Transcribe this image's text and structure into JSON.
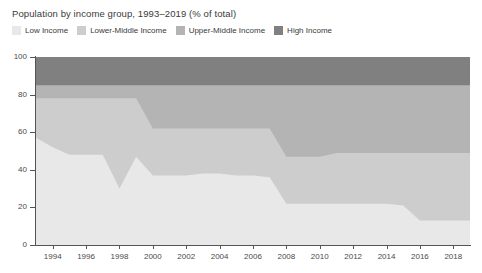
{
  "title": "Population by income group, 1993–2019 (% of total)",
  "legend": {
    "items": [
      {
        "label": "Low Income",
        "color": "#e8e8e8",
        "swatch_name": "legend-swatch-low-income"
      },
      {
        "label": "Lower-Middle Income",
        "color": "#cdcdcd",
        "swatch_name": "legend-swatch-lower-middle-income"
      },
      {
        "label": "Upper-Middle Income",
        "color": "#b4b4b4",
        "swatch_name": "legend-swatch-upper-middle-income"
      },
      {
        "label": "High Income",
        "color": "#808080",
        "swatch_name": "legend-swatch-high-income"
      }
    ]
  },
  "axes": {
    "y_ticks": [
      "0",
      "20",
      "40",
      "60",
      "80",
      "100"
    ],
    "x_ticks": [
      "1994",
      "1996",
      "1998",
      "2000",
      "2002",
      "2004",
      "2006",
      "2008",
      "2010",
      "2012",
      "2014",
      "2016",
      "2018"
    ]
  },
  "chart_data": {
    "type": "area",
    "title": "Population by income group, 1993–2019 (% of total)",
    "xlabel": "",
    "ylabel": "",
    "ylim": [
      0,
      100
    ],
    "xlim": [
      1993,
      2019
    ],
    "stacked": true,
    "grid": false,
    "legend_position": "top-left",
    "x": [
      1993,
      1994,
      1995,
      1996,
      1997,
      1998,
      1999,
      2000,
      2001,
      2002,
      2003,
      2004,
      2005,
      2006,
      2007,
      2008,
      2009,
      2010,
      2011,
      2012,
      2013,
      2014,
      2015,
      2016,
      2017,
      2018,
      2019
    ],
    "categories": [
      "1993",
      "1994",
      "1995",
      "1996",
      "1997",
      "1998",
      "1999",
      "2000",
      "2001",
      "2002",
      "2003",
      "2004",
      "2005",
      "2006",
      "2007",
      "2008",
      "2009",
      "2010",
      "2011",
      "2012",
      "2013",
      "2014",
      "2015",
      "2016",
      "2017",
      "2018",
      "2019"
    ],
    "series": [
      {
        "name": "Low Income",
        "color": "#e8e8e8",
        "values": [
          57,
          52,
          48,
          48,
          48,
          30,
          47,
          37,
          37,
          37,
          38,
          38,
          37,
          37,
          36,
          22,
          22,
          22,
          22,
          22,
          22,
          22,
          21,
          13,
          13,
          13,
          13
        ]
      },
      {
        "name": "Lower-Middle Income",
        "color": "#cdcdcd",
        "values": [
          21,
          26,
          30,
          30,
          30,
          48,
          31,
          25,
          25,
          25,
          24,
          24,
          25,
          25,
          26,
          25,
          25,
          25,
          27,
          27,
          27,
          27,
          28,
          36,
          36,
          36,
          36
        ]
      },
      {
        "name": "Upper-Middle Income",
        "color": "#b4b4b4",
        "values": [
          7,
          7,
          7,
          7,
          7,
          7,
          7,
          23,
          23,
          23,
          23,
          23,
          23,
          23,
          23,
          38,
          38,
          38,
          36,
          36,
          36,
          36,
          36,
          36,
          36,
          36,
          36
        ]
      },
      {
        "name": "High Income",
        "color": "#808080",
        "values": [
          15,
          15,
          15,
          15,
          15,
          15,
          15,
          15,
          15,
          15,
          15,
          15,
          15,
          15,
          15,
          15,
          15,
          15,
          15,
          15,
          15,
          15,
          15,
          15,
          15,
          15,
          15
        ]
      }
    ],
    "cumulative_tops": {
      "low_income": [
        57,
        52,
        48,
        48,
        48,
        30,
        47,
        37,
        37,
        37,
        38,
        38,
        37,
        37,
        36,
        22,
        22,
        22,
        22,
        22,
        22,
        22,
        21,
        13,
        13,
        13,
        13
      ],
      "lower_middle": [
        78,
        78,
        78,
        78,
        78,
        78,
        78,
        62,
        62,
        62,
        62,
        62,
        62,
        62,
        62,
        47,
        47,
        47,
        49,
        49,
        49,
        49,
        49,
        49,
        49,
        49,
        49
      ],
      "upper_middle": [
        85,
        85,
        85,
        85,
        85,
        85,
        85,
        85,
        85,
        85,
        85,
        85,
        85,
        85,
        85,
        85,
        85,
        85,
        85,
        85,
        85,
        85,
        85,
        85,
        85,
        85,
        85
      ],
      "high_income": [
        100,
        100,
        100,
        100,
        100,
        100,
        100,
        100,
        100,
        100,
        100,
        100,
        100,
        100,
        100,
        100,
        100,
        100,
        100,
        100,
        100,
        100,
        100,
        100,
        100,
        100,
        100
      ]
    }
  },
  "colors": {
    "low_income": "#e8e8e8",
    "lower_middle_income": "#cdcdcd",
    "upper_middle_income": "#b4b4b4",
    "high_income": "#808080",
    "axis": "#555555",
    "text": "#3a3a3a",
    "background": "#ffffff"
  }
}
